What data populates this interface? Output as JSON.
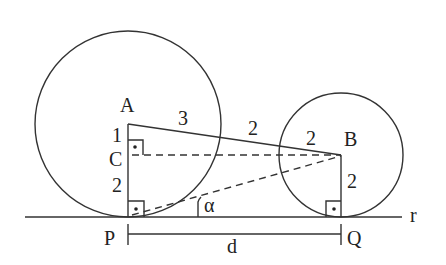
{
  "diagram": {
    "type": "geometry",
    "colors": {
      "stroke": "#333333",
      "text": "#222222",
      "background": "#ffffff"
    },
    "line": {
      "label": "r",
      "y": 217,
      "x1": 25,
      "x2": 402
    },
    "circles": [
      {
        "name": "large",
        "center_label": "A",
        "cx": 128,
        "cy": 124,
        "r": 93
      },
      {
        "name": "small",
        "center_label": "B",
        "cx": 341,
        "cy": 155,
        "r": 62
      }
    ],
    "points": {
      "A": {
        "label": "A",
        "x": 128,
        "y": 124
      },
      "B": {
        "label": "B",
        "x": 341,
        "y": 155
      },
      "C": {
        "label": "C",
        "x": 128,
        "y": 155
      },
      "P": {
        "label": "P",
        "x": 128,
        "y": 217
      },
      "Q": {
        "label": "Q",
        "x": 341,
        "y": 217
      }
    },
    "segment_labels": {
      "AC": "1",
      "CP": "2",
      "A_to_circle": "3",
      "circle_to_circle": "2",
      "circle_to_B": "2",
      "BQ": "2",
      "PQ": "d"
    },
    "angle_label": "α"
  }
}
